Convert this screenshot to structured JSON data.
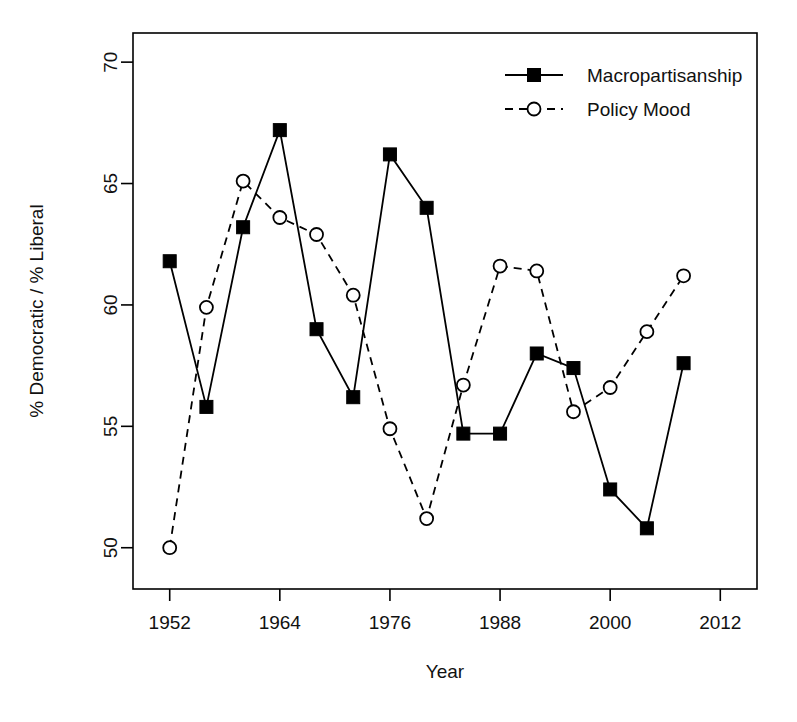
{
  "figure": {
    "background": "#ffffff",
    "line_color": "#000000",
    "frame": {
      "x0": 133,
      "y0": 33,
      "x1": 757,
      "y1": 589
    }
  },
  "axes": {
    "x": {
      "label": "Year",
      "ticks": [
        1952,
        1964,
        1976,
        1988,
        2000,
        2012
      ],
      "tick_labels": [
        "1952",
        "1964",
        "1976",
        "1988",
        "2000",
        "2012"
      ],
      "min": 1948.0,
      "max": 2016.0
    },
    "y": {
      "label": "% Democratic / % Liberal",
      "ticks": [
        50,
        55,
        60,
        65,
        70
      ],
      "tick_labels": [
        "50",
        "55",
        "60",
        "65",
        "70"
      ],
      "min": 48.3,
      "max": 71.2
    }
  },
  "legend": {
    "position": "top-right",
    "entries": [
      {
        "label": "Macropartisanship",
        "marker": "filled-square",
        "line": "solid"
      },
      {
        "label": "Policy Mood",
        "marker": "open-circle",
        "line": "dashed"
      }
    ]
  },
  "chart_data": {
    "type": "line",
    "title": "",
    "xlabel": "Year",
    "ylabel": "% Democratic / % Liberal",
    "xlim": [
      1948.0,
      2016.0
    ],
    "ylim": [
      48.3,
      71.2
    ],
    "grid": false,
    "legend_position": "top-right",
    "x": [
      1952,
      1956,
      1960,
      1964,
      1968,
      1972,
      1976,
      1980,
      1984,
      1988,
      1992,
      1996,
      2000,
      2004,
      2008
    ],
    "series": [
      {
        "name": "Macropartisanship",
        "marker": "filled-square",
        "line": "solid",
        "values": [
          61.8,
          55.8,
          63.2,
          67.2,
          59.0,
          56.2,
          66.2,
          64.0,
          54.7,
          54.7,
          58.0,
          57.4,
          52.4,
          50.8,
          57.6
        ]
      },
      {
        "name": "Policy Mood",
        "marker": "open-circle",
        "line": "dashed",
        "values": [
          50.0,
          59.9,
          65.1,
          63.6,
          62.9,
          60.4,
          54.9,
          51.2,
          56.7,
          61.6,
          61.4,
          55.6,
          56.6,
          58.9,
          61.2
        ]
      }
    ]
  }
}
